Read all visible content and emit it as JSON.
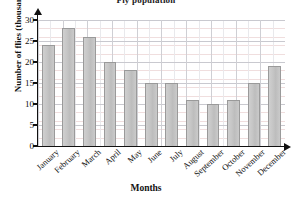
{
  "chart_data": {
    "type": "bar",
    "title": "Fly population",
    "xlabel": "Months",
    "ylabel": "Number of flies (thousands)",
    "categories": [
      "January",
      "February",
      "March",
      "April",
      "May",
      "June",
      "July",
      "August",
      "September",
      "October",
      "November",
      "December"
    ],
    "values": [
      24,
      28,
      26,
      20,
      18,
      15,
      15,
      11,
      10,
      11,
      15,
      19
    ],
    "ylim": [
      0,
      30
    ],
    "yticks": [
      0,
      5,
      10,
      15,
      20,
      25,
      30
    ],
    "ytick_labels": [
      "0",
      "5",
      "10",
      "15",
      "20",
      "25",
      "30"
    ],
    "grid": true,
    "legend": null,
    "bar_color": "#c6c6c6",
    "bar_border_color": "#9a9a9a",
    "grid_color": "#c9c9cf",
    "axis_color": "#111111"
  }
}
